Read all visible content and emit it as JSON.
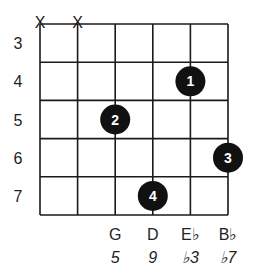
{
  "diagram": {
    "type": "guitar-chord-diagram",
    "string_count": 6,
    "fret_labels": [
      "3",
      "4",
      "5",
      "6",
      "7"
    ],
    "muted_strings": [
      1,
      2
    ],
    "mute_symbol": "X",
    "fingers": [
      {
        "finger": "1",
        "string": 5,
        "fret_row": 2
      },
      {
        "finger": "2",
        "string": 3,
        "fret_row": 3
      },
      {
        "finger": "3",
        "string": 6,
        "fret_row": 4
      },
      {
        "finger": "4",
        "string": 4,
        "fret_row": 5
      }
    ],
    "notes": [
      {
        "string": 3,
        "note": "G",
        "interval": "5"
      },
      {
        "string": 4,
        "note": "D",
        "interval": "9"
      },
      {
        "string": 5,
        "note": "E♭",
        "interval": "♭3"
      },
      {
        "string": 6,
        "note": "B♭",
        "interval": "♭7"
      }
    ],
    "colors": {
      "grid": "#1a1a1a",
      "dot": "#111111",
      "dot_text": "#ffffff"
    }
  }
}
